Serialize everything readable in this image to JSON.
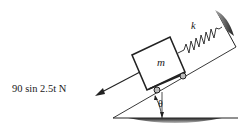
{
  "diagram": {
    "type": "mass-spring system on inclined plane",
    "labels": {
      "force": "90 sin 2.5t N",
      "mass": "m",
      "spring": "k",
      "angle": "θ"
    },
    "components": [
      "block",
      "wheels",
      "spring",
      "wall",
      "incline",
      "ground",
      "force-arrow",
      "angle-arc"
    ]
  }
}
